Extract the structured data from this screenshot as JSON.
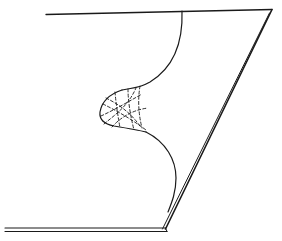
{
  "diagram": {
    "type": "line-drawing",
    "description": "Folded sheet (parallelogram outline) with a curved fold edge forming a cusp region rendered with a dashed mesh",
    "colors": {
      "background": "#ffffff",
      "stroke": "#1a1a1a"
    },
    "elements": {
      "top_edge": "Top edge of sheet",
      "right_edge": "Right diagonal edge of sheet (double line)",
      "bottom_edge": "Bottom edge of sheet (double line)",
      "fold_curve": "Fold curve descending from top edge",
      "cusp_region": "Cusp lobe with dashed mesh lines"
    }
  }
}
